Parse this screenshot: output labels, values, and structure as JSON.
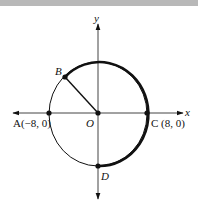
{
  "diagram": {
    "type": "circle-on-coordinate-plane",
    "axes": {
      "x_label": "x",
      "y_label": "y"
    },
    "points": {
      "A": {
        "name": "A",
        "coords": "(−8, 0)"
      },
      "B": {
        "name": "B"
      },
      "C": {
        "name": "C",
        "coords": "(8, 0)"
      },
      "D": {
        "name": "D"
      },
      "O": {
        "name": "O"
      }
    },
    "labels": {
      "A": "A(−8, 0)",
      "B": "B",
      "C": "C (8, 0)",
      "D": "D",
      "O": "O",
      "x": "x",
      "y": "y"
    },
    "highlighted_arc": "B to C to D (clockwise, bold)",
    "segment": "OB",
    "colors": {
      "line": "#111111",
      "band": "#b8b8b8",
      "background": "#ffffff"
    }
  }
}
